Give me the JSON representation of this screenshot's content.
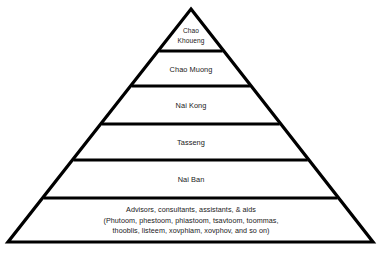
{
  "diagram": {
    "type": "pyramid-hierarchy",
    "shape": {
      "apex": {
        "x": 191,
        "y": 9
      },
      "base_left": {
        "x": 8,
        "y": 242
      },
      "base_right": {
        "x": 373,
        "y": 242
      },
      "stroke_color": "#000000",
      "fill_color": "#ffffff"
    },
    "divider_y": [
      51,
      86,
      124,
      160,
      198
    ],
    "tiers": [
      {
        "level": 1,
        "position": "apex",
        "lines": [
          "Chao",
          "Khoueng"
        ],
        "center_y": 36,
        "line_height": 9.5,
        "size": "small"
      },
      {
        "level": 2,
        "lines": [
          "Chao Muong"
        ],
        "center_y": 70,
        "line_height": 10,
        "size": "normal"
      },
      {
        "level": 3,
        "lines": [
          "Nai Kong"
        ],
        "center_y": 106,
        "line_height": 10,
        "size": "normal"
      },
      {
        "level": 4,
        "lines": [
          "Tasseng"
        ],
        "center_y": 143,
        "line_height": 10,
        "size": "normal"
      },
      {
        "level": 5,
        "lines": [
          "Nai Ban"
        ],
        "center_y": 180,
        "line_height": 10,
        "size": "normal"
      },
      {
        "level": 6,
        "position": "base",
        "lines": [
          "Advisors, consultants, assistants, & aids",
          "(Phutoom, phestoom, phiastoom, tsavtoom, toommas,",
          "thooblis, listeem, xovphiam, xovphov, and so on)"
        ],
        "center_y": 221,
        "line_height": 10.5,
        "size": "base"
      }
    ]
  }
}
